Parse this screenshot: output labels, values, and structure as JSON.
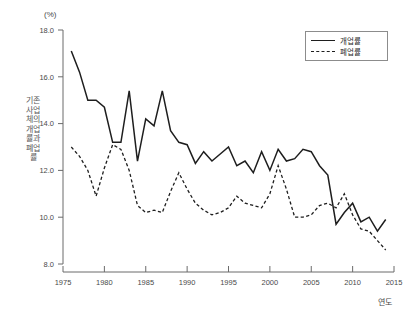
{
  "chart_data": {
    "type": "line",
    "title": "",
    "unit_label": "(%)",
    "xlabel": "연도",
    "ylabel": "기존 사업체의 개업률과 폐업률",
    "grid": false,
    "legend_position": "top-right",
    "xlim": [
      1975,
      2015
    ],
    "ylim": [
      8.0,
      18.0
    ],
    "xticks": [
      1975,
      1980,
      1985,
      1990,
      1995,
      2000,
      2005,
      2010,
      2015
    ],
    "yticks": [
      8.0,
      10.0,
      12.0,
      14.0,
      16.0,
      18.0
    ],
    "ytick_labels": [
      "8.0",
      "10.0",
      "12.0",
      "14.0",
      "16.0",
      "18.0"
    ],
    "xtick_labels": [
      "1975",
      "1980",
      "1985",
      "1990",
      "1995",
      "2000",
      "2005",
      "2010",
      "2015"
    ],
    "x": [
      1976,
      1977,
      1978,
      1979,
      1980,
      1981,
      1982,
      1983,
      1984,
      1985,
      1986,
      1987,
      1988,
      1989,
      1990,
      1991,
      1992,
      1993,
      1994,
      1995,
      1996,
      1997,
      1998,
      1999,
      2000,
      2001,
      2002,
      2003,
      2004,
      2005,
      2006,
      2007,
      2008,
      2009,
      2010,
      2011,
      2012,
      2013,
      2014
    ],
    "series": [
      {
        "name": "개업률",
        "style": "solid",
        "color": "#1e1e1e",
        "values": [
          17.1,
          16.2,
          15.0,
          15.0,
          14.7,
          13.2,
          13.2,
          15.4,
          12.4,
          14.2,
          13.9,
          15.4,
          13.7,
          13.2,
          13.1,
          12.3,
          12.8,
          12.4,
          12.7,
          13.0,
          12.2,
          12.4,
          11.9,
          12.8,
          12.0,
          12.9,
          12.4,
          12.5,
          12.9,
          12.8,
          12.2,
          11.8,
          9.7,
          10.2,
          10.6,
          9.8,
          10.0,
          9.4,
          9.9
        ]
      },
      {
        "name": "폐업률",
        "style": "dashed",
        "color": "#1e1e1e",
        "values": [
          13.0,
          12.6,
          12.0,
          10.9,
          12.1,
          13.1,
          12.9,
          12.0,
          10.5,
          10.2,
          10.3,
          10.2,
          11.1,
          11.9,
          11.2,
          10.6,
          10.3,
          10.1,
          10.2,
          10.4,
          10.9,
          10.6,
          10.5,
          10.4,
          11.0,
          12.2,
          11.2,
          10.0,
          10.0,
          10.1,
          10.5,
          10.6,
          10.4,
          11.0,
          10.1,
          9.5,
          9.4,
          9.0,
          8.6
        ]
      }
    ]
  },
  "legend": {
    "items": [
      {
        "label": "개업률",
        "style": "solid"
      },
      {
        "label": "폐업률",
        "style": "dashed"
      }
    ]
  }
}
